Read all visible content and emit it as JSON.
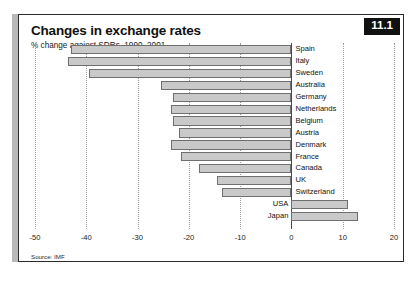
{
  "figure": {
    "badge": "11.1",
    "title": "Changes in exchange rates",
    "subtitle": "% change against SDRs, 1990–2001",
    "source": "Source: IMF"
  },
  "chart_data": {
    "type": "bar",
    "orientation": "horizontal",
    "title": "Changes in exchange rates",
    "subtitle": "% change against SDRs, 1990–2001",
    "xlabel": "",
    "ylabel": "",
    "xlim": [
      -50,
      20
    ],
    "ticks": [
      "-50",
      "-40",
      "-30",
      "-20",
      "-10",
      "0",
      "10",
      "20"
    ],
    "tick_values": [
      -50,
      -40,
      -30,
      -20,
      -10,
      0,
      10,
      20
    ],
    "grid": true,
    "legend": null,
    "source": "Source: IMF",
    "categories": [
      "Spain",
      "Italy",
      "Sweden",
      "Australia",
      "Germany",
      "Netherlands",
      "Belgium",
      "Austria",
      "Denmark",
      "France",
      "Canada",
      "UK",
      "Switzerland",
      "USA",
      "Japan"
    ],
    "values": [
      -43,
      -43.5,
      -39.5,
      -25.5,
      -23,
      -23.5,
      -23,
      -22,
      -23.5,
      -21.5,
      -18,
      -14.5,
      -13.5,
      11,
      13
    ],
    "bars": [
      {
        "label": "Spain",
        "value": -43,
        "label_side": "right"
      },
      {
        "label": "Italy",
        "value": -43.5,
        "label_side": "right"
      },
      {
        "label": "Sweden",
        "value": -39.5,
        "label_side": "right"
      },
      {
        "label": "Australia",
        "value": -25.5,
        "label_side": "right"
      },
      {
        "label": "Germany",
        "value": -23,
        "label_side": "right"
      },
      {
        "label": "Netherlands",
        "value": -23.5,
        "label_side": "right"
      },
      {
        "label": "Belgium",
        "value": -23,
        "label_side": "right"
      },
      {
        "label": "Austria",
        "value": -22,
        "label_side": "right"
      },
      {
        "label": "Denmark",
        "value": -23.5,
        "label_side": "right"
      },
      {
        "label": "France",
        "value": -21.5,
        "label_side": "right"
      },
      {
        "label": "Canada",
        "value": -18,
        "label_side": "right"
      },
      {
        "label": "UK",
        "value": -14.5,
        "label_side": "right"
      },
      {
        "label": "Switzerland",
        "value": -13.5,
        "label_side": "right"
      },
      {
        "label": "USA",
        "value": 11,
        "label_side": "left"
      },
      {
        "label": "Japan",
        "value": 13,
        "label_side": "left"
      }
    ]
  }
}
